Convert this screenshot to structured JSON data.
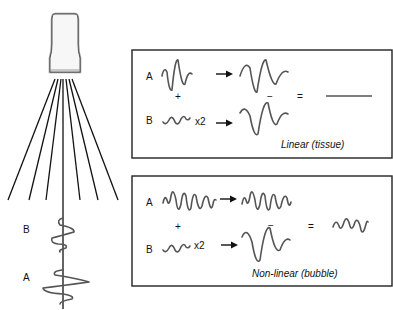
{
  "diagram": {
    "transducer": {
      "icon": "ultrasound-transducer-icon",
      "beam_count": 7
    },
    "depth_labels": {
      "b": "B",
      "a": "A"
    },
    "panels": [
      {
        "id": "linear",
        "caption": "Linear (tissue)",
        "row_a": {
          "label": "A",
          "operator_below": "+"
        },
        "row_b": {
          "label": "B",
          "multiplier": "x2"
        },
        "minus": "−",
        "equals": "=",
        "result": "flat line (cancellation)"
      },
      {
        "id": "nonlinear",
        "caption": "Non-linear (bubble)",
        "row_a": {
          "label": "A",
          "operator_below": "+"
        },
        "row_b": {
          "label": "B",
          "multiplier": "x2"
        },
        "minus": "−",
        "equals": "=",
        "result": "residual harmonic wave"
      }
    ],
    "colors": {
      "lines": "#111111",
      "waves": "#555555",
      "background": "#ffffff"
    }
  }
}
